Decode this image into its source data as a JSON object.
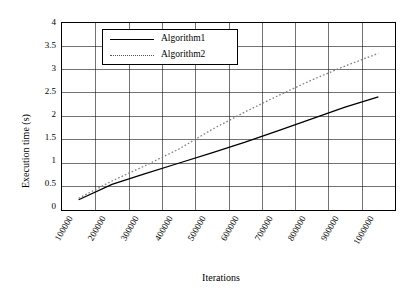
{
  "chart_data": {
    "type": "line",
    "title": "",
    "xlabel": "Iterations",
    "ylabel": "Execution time (s)",
    "xtick_labels": [
      "100000",
      "200000",
      "300000",
      "400000",
      "500000",
      "600000",
      "700000",
      "800000",
      "900000",
      "1000000"
    ],
    "x": [
      100000,
      200000,
      300000,
      400000,
      500000,
      600000,
      700000,
      800000,
      900000,
      1000000
    ],
    "ytick_labels": [
      "0",
      "0.5",
      "1",
      "1.5",
      "2",
      "2.5",
      "3",
      "3.5",
      "4"
    ],
    "ylim": [
      0,
      4
    ],
    "grid": true,
    "legend_position": "top-left-inside",
    "series": [
      {
        "name": "Algorithm1",
        "style": "solid",
        "color": "#000000",
        "values": [
          0.22,
          0.55,
          0.78,
          1.0,
          1.22,
          1.45,
          1.7,
          1.95,
          2.2,
          2.42
        ]
      },
      {
        "name": "Algorithm2",
        "style": "dotted",
        "color": "#808080",
        "values": [
          0.25,
          0.62,
          0.95,
          1.3,
          1.72,
          2.1,
          2.45,
          2.78,
          3.08,
          3.35
        ]
      }
    ]
  },
  "axis": {
    "y_title": "Execution time (s)",
    "x_title": "Iterations"
  },
  "legend": {
    "items": [
      {
        "label": "Algorithm1"
      },
      {
        "label": "Algorithm2"
      }
    ]
  }
}
